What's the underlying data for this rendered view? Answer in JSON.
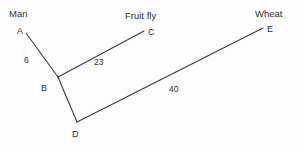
{
  "diagram": {
    "type": "unrooted-tree",
    "background_color": "#fdfdfd",
    "line_color": "#3b3b42",
    "text_color": "#2f2f2f",
    "taxa": [
      {
        "id": "man",
        "label": "Man",
        "x": 9,
        "y": 9
      },
      {
        "id": "fruit-fly",
        "label": "Fruit fly",
        "x": 125,
        "y": 11
      },
      {
        "id": "wheat",
        "label": "Wheat",
        "x": 255,
        "y": 9
      }
    ],
    "nodes": [
      {
        "id": "A",
        "label": "A",
        "x": 17,
        "y": 27,
        "point_x": 26,
        "point_y": 33
      },
      {
        "id": "B",
        "label": "B",
        "x": 41,
        "y": 84,
        "point_x": 58,
        "point_y": 77
      },
      {
        "id": "C",
        "label": "C",
        "x": 148,
        "y": 28,
        "point_x": 144,
        "point_y": 31
      },
      {
        "id": "D",
        "label": "D",
        "x": 72,
        "y": 130,
        "point_x": 77,
        "point_y": 122
      },
      {
        "id": "E",
        "label": "E",
        "x": 267,
        "y": 25,
        "point_x": 263,
        "point_y": 28
      }
    ],
    "edges": [
      {
        "id": "A-B",
        "from": "A",
        "to": "B",
        "length_label": "6",
        "label_x": 24,
        "label_y": 56
      },
      {
        "id": "B-C",
        "from": "B",
        "to": "C",
        "length_label": "23",
        "label_x": 94,
        "label_y": 58
      },
      {
        "id": "B-D",
        "from": "B",
        "to": "D",
        "length_label": "",
        "label_x": 0,
        "label_y": 0
      },
      {
        "id": "D-E",
        "from": "D",
        "to": "E",
        "length_label": "40",
        "label_x": 169,
        "label_y": 85
      }
    ]
  }
}
